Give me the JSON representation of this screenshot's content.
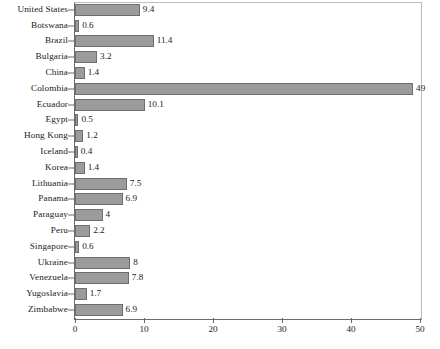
{
  "chart_data": {
    "type": "bar",
    "orientation": "horizontal",
    "title": "",
    "xlabel": "",
    "ylabel": "",
    "xlim": [
      0,
      50
    ],
    "grid": false,
    "legend": null,
    "xticks": [
      0,
      10,
      20,
      30,
      40,
      50
    ],
    "xtick_labels": [
      "0",
      "10",
      "20",
      "30",
      "40",
      "50"
    ],
    "categories": [
      "United States",
      "Botswana",
      "Brazil",
      "Bulgaria",
      "China",
      "Colombia",
      "Ecuador",
      "Egypt",
      "Hong Kong",
      "Iceland",
      "Korea",
      "Lithuania",
      "Panama",
      "Paraguay",
      "Peru",
      "Singapore",
      "Ukraine",
      "Venezuela",
      "Yugoslavia",
      "Zimbabwe"
    ],
    "values": [
      9.4,
      0.6,
      11.4,
      3.2,
      1.4,
      49,
      10.1,
      0.5,
      1.2,
      0.4,
      1.4,
      7.5,
      6.9,
      4,
      2.2,
      0.6,
      8,
      7.8,
      1.7,
      6.9
    ],
    "value_labels": [
      "9.4",
      "0.6",
      "11.4",
      "3.2",
      "1.4",
      "49",
      "10.1",
      "0.5",
      "1.2",
      "0.4",
      "1.4",
      "7.5",
      "6.9",
      "4",
      "2.2",
      "0.6",
      "8",
      "7.8",
      "1.7",
      "6.9"
    ],
    "bar_color": "#9b9b9b",
    "bar_border_color": "#6e6e6e",
    "axis_color": "#6b6b6b",
    "frame_color": "#bdbdbd",
    "background_color": "#ffffff",
    "text_color": "#1a1a1a"
  }
}
